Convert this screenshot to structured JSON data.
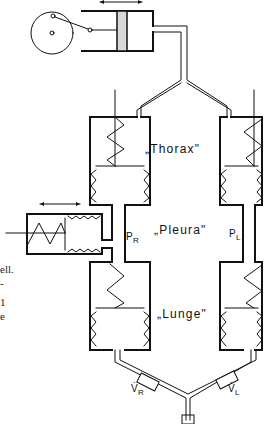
{
  "diagram": {
    "type": "lung-thorax mechanical model",
    "labels": {
      "thorax": "„Thorax\"",
      "pleura": "„Pleura\"",
      "lunge": "„Lunge\""
    },
    "pressure_symbols": {
      "right": {
        "main": "P",
        "sub": "R"
      },
      "left": {
        "main": "P",
        "sub": "L"
      }
    },
    "flow_symbols": {
      "right": {
        "main": "V̇",
        "sub": "R"
      },
      "left": {
        "main": "V̇",
        "sub": "L"
      }
    },
    "cutoff_text": [
      "ell.",
      "-",
      "1",
      "e"
    ],
    "components": [
      "crank-wheel",
      "drive-piston-cylinder",
      "right-thorax-chamber",
      "left-thorax-chamber",
      "pleura-pump-cylinder",
      "right-lung-chamber",
      "left-lung-chamber",
      "right-airway-resistance",
      "left-airway-resistance",
      "trachea-outlet"
    ],
    "colors": {
      "line": "#111111",
      "piston_fill": "#d9d9d9",
      "background": "#ffffff"
    }
  }
}
